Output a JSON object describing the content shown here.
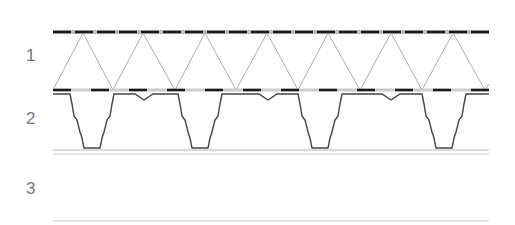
{
  "labels": [
    {
      "text": "1",
      "x": 28,
      "y": 46
    },
    {
      "text": "2",
      "x": 28,
      "y": 109
    },
    {
      "text": "3",
      "x": 28,
      "y": 179
    }
  ],
  "colors": {
    "dark": "#1a1a1a",
    "truss": "#999999",
    "profile": "#444444",
    "line": "#bbbbbb"
  },
  "truss": {
    "top_apexes": [
      83,
      143,
      205,
      267,
      328,
      391,
      453
    ],
    "bottom_vertices": [
      53,
      113,
      175,
      236,
      298,
      360,
      422,
      485
    ]
  },
  "profile": {
    "ribs_start": [
      53,
      178,
      298,
      422
    ]
  }
}
